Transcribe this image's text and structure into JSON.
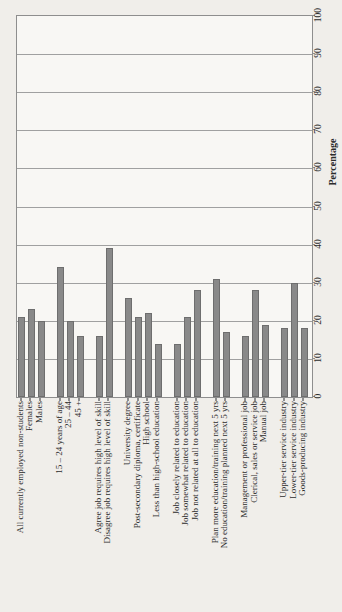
{
  "chart_data": {
    "type": "bar",
    "title": "",
    "xlabel": "Percentage",
    "ylabel": "",
    "orientation_note": "horizontal bar chart rotated 90 degrees counter-clockwise on the page: value axis (0-100) runs bottom-to-top along the right edge, category labels read bottom-to-top below the baseline",
    "axis": {
      "min": 0,
      "max": 100,
      "tick_step": 10,
      "tick_labels": [
        "0",
        "10",
        "20",
        "30",
        "40",
        "50",
        "60",
        "70",
        "80",
        "90",
        "100"
      ],
      "grid": true
    },
    "groups": [
      {
        "bars": [
          {
            "label": "All currently employed non-students",
            "value": 21
          },
          {
            "label": "Females",
            "value": 23
          },
          {
            "label": "Males",
            "value": 20
          }
        ]
      },
      {
        "bars": [
          {
            "label": "15 – 24 years of age",
            "value": 34
          },
          {
            "label": "25 – 44",
            "value": 20
          },
          {
            "label": "45 +",
            "value": 16
          }
        ]
      },
      {
        "bars": [
          {
            "label": "Agree job requires high level of skill",
            "value": 16
          },
          {
            "label": "Disagree job requires high level of skill",
            "value": 39
          }
        ]
      },
      {
        "bars": [
          {
            "label": "University degree",
            "value": 26
          },
          {
            "label": "Post-secondary diploma, certificate",
            "value": 21
          },
          {
            "label": "High school",
            "value": 22
          },
          {
            "label": "Less than high-school education",
            "value": 14
          }
        ]
      },
      {
        "bars": [
          {
            "label": "Job closely related to education",
            "value": 14
          },
          {
            "label": "Job somewhat related to education",
            "value": 21
          },
          {
            "label": "Job not related at all to education",
            "value": 28
          }
        ]
      },
      {
        "bars": [
          {
            "label": "Plan more education/training next 5 yrs",
            "value": 31
          },
          {
            "label": "No education/training planned next 5 yrs",
            "value": 17
          }
        ]
      },
      {
        "bars": [
          {
            "label": "Management or professional job",
            "value": 16
          },
          {
            "label": "Clerical, sales or service job",
            "value": 28
          },
          {
            "label": "Manual job",
            "value": 19
          }
        ]
      },
      {
        "bars": [
          {
            "label": "Upper-tier service industry",
            "value": 18
          },
          {
            "label": "Lower-tier service industry",
            "value": 30
          },
          {
            "label": "Goods-producing industry",
            "value": 18
          }
        ]
      }
    ],
    "colors": {
      "bar_fill": "#898989",
      "bar_edge": "#6e6e6e",
      "grid_line": "#a0a0a0",
      "frame": "#8e8e8e",
      "text": "#2c2c2c",
      "page_background": "#f0eeea",
      "plot_background": "#f8f7f4"
    }
  }
}
